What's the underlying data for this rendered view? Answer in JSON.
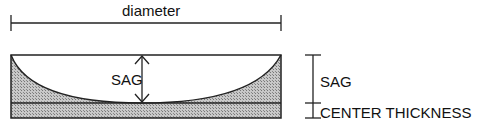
{
  "diagram": {
    "labels": {
      "diameter": "diameter",
      "sag_inner": "SAG",
      "sag_side": "SAG",
      "center_thickness": "CENTER THICKNESS"
    },
    "colors": {
      "stroke": "#222222",
      "fill_hatch": "#b8b8b8",
      "background": "#ffffff"
    }
  }
}
